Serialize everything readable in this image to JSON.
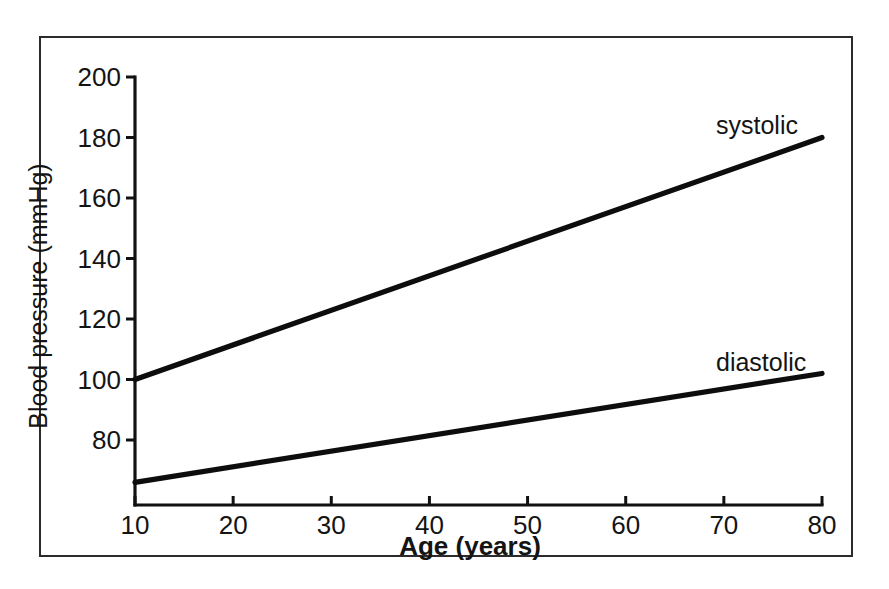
{
  "figure": {
    "background_color": "#ffffff",
    "frame_color": "#2b2b2b",
    "line_color": "#0d0d0d"
  },
  "chart_data": {
    "type": "line",
    "title": "",
    "subtitle": "",
    "xlabel": "Age (years)",
    "ylabel": "Blood pressure (mmHg)",
    "xlim": [
      10,
      80
    ],
    "ylim": [
      60,
      200
    ],
    "xticks": [
      10,
      20,
      30,
      40,
      50,
      60,
      70,
      80
    ],
    "xticklabels": [
      "10",
      "20",
      "30",
      "40",
      "50",
      "60",
      "70",
      "80"
    ],
    "yticks": [
      80,
      100,
      120,
      140,
      160,
      180,
      200
    ],
    "yticklabels": [
      "80",
      "100",
      "120",
      "140",
      "160",
      "180",
      "200"
    ],
    "grid": false,
    "legend_position": "inline-right",
    "x": [
      10,
      80
    ],
    "series": [
      {
        "name": "systolic",
        "label": "systolic",
        "values": [
          100,
          180
        ],
        "color": "#0d0d0d"
      },
      {
        "name": "diastolic",
        "label": "diastolic",
        "values": [
          66,
          102
        ],
        "color": "#0d0d0d"
      }
    ],
    "annotations": [
      {
        "name": "systolic-label",
        "text": "systolic",
        "x": 66,
        "y": 188
      },
      {
        "name": "diastolic-label",
        "text": "diastolic",
        "x": 66,
        "y": 103
      }
    ]
  }
}
